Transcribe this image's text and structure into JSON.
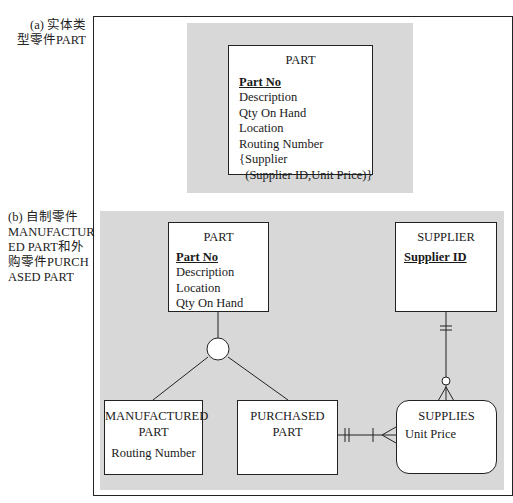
{
  "cut_text": "……实体类型……(部分文字被截断)……",
  "labels": {
    "a": "(a) 实体类\n型零件PART",
    "a_line1": "(a) 实体类",
    "a_line2": "型零件PART",
    "b_line1": "(b) 自制零件",
    "b_line2": "MANUFACTUR",
    "b_line3": "ED  PART和外",
    "b_line4": "购零件PURCH",
    "b_line5": "ASED PART"
  },
  "diagram_a": {
    "entity": {
      "name": "PART",
      "primary_key": "Part No",
      "attributes": [
        "Description",
        "Qty On Hand",
        "Location",
        "Routing Number",
        "{Supplier",
        "  (Supplier ID,Unit Price)}"
      ]
    }
  },
  "diagram_b": {
    "part": {
      "name": "PART",
      "primary_key": "Part No",
      "attributes": [
        "Description",
        "Location",
        "Qty On Hand"
      ]
    },
    "supplier": {
      "name": "SUPPLIER",
      "primary_key": "Supplier ID"
    },
    "manufactured_part": {
      "name_line1": "MANUFACTURED",
      "name_line2": "PART",
      "attributes": [
        "Routing Number"
      ]
    },
    "purchased_part": {
      "name_line1": "PURCHASED",
      "name_line2": "PART"
    },
    "supplies": {
      "name": "SUPPLIES",
      "attributes": [
        "Unit Price"
      ]
    }
  },
  "colors": {
    "panel": "#d8d8d8",
    "line": "#222222",
    "box": "#ffffff"
  }
}
